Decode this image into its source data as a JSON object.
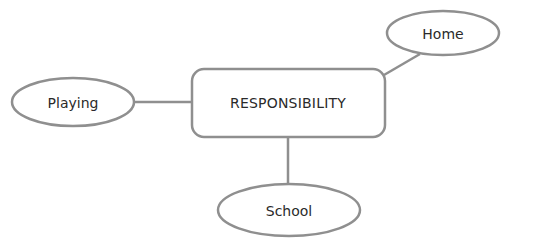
{
  "diagram": {
    "type": "mind-map",
    "center": {
      "label": "RESPONSIBILITY"
    },
    "nodes": [
      {
        "id": "playing",
        "label": "Playing"
      },
      {
        "id": "home",
        "label": "Home"
      },
      {
        "id": "school",
        "label": "School"
      }
    ],
    "edges": [
      {
        "from": "center",
        "to": "playing"
      },
      {
        "from": "center",
        "to": "home"
      },
      {
        "from": "center",
        "to": "school"
      }
    ],
    "colors": {
      "stroke": "#8f8f8f",
      "text": "#2a2a2a",
      "background": "#ffffff"
    }
  }
}
